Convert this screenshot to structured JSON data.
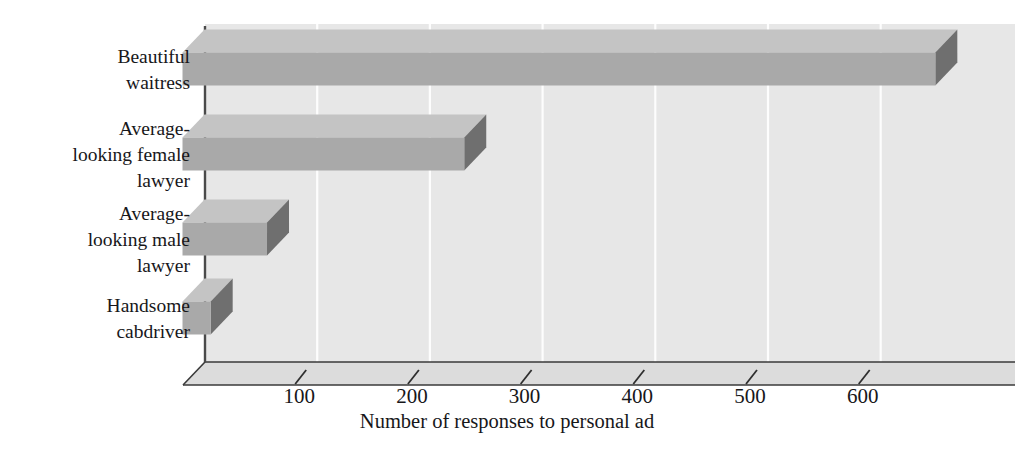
{
  "chart_data": {
    "type": "bar",
    "orientation": "horizontal",
    "style": "3d",
    "title": "",
    "subtitle": "",
    "xlabel": "Number of responses to personal ad",
    "ylabel": "",
    "categories": [
      "Beautiful waitress",
      "Average-looking female lawyer",
      "Average-looking male lawyer",
      "Handsome cabdriver"
    ],
    "category_lines": [
      [
        "Beautiful",
        "waitress"
      ],
      [
        "Average-",
        "looking female",
        "lawyer"
      ],
      [
        "Average-",
        "looking male",
        "lawyer"
      ],
      [
        "Handsome",
        "cabdriver"
      ]
    ],
    "values": [
      668,
      250,
      75,
      25
    ],
    "xlim": [
      0,
      700
    ],
    "xticks": [
      100,
      200,
      300,
      400,
      500,
      600
    ],
    "xtick_labels": [
      "100",
      "200",
      "300",
      "400",
      "500",
      "600"
    ],
    "grid": "vertical-white",
    "legend": "none",
    "colors": {
      "bar_front": "#a9a9a9",
      "bar_side": "#6f6f6f",
      "bar_top": "#c4c4c4",
      "plot_wall": "#e7e7e7",
      "floor": "#dcdcdc",
      "gridline": "#fdfdfd",
      "axis_line": "#3a3a3a",
      "text": "#17171a",
      "page_background": "#ffffff"
    }
  }
}
